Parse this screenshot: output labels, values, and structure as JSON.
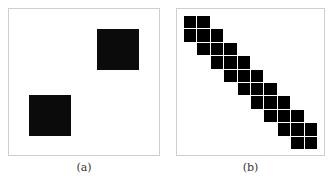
{
  "panels": [
    {
      "id": "a",
      "caption": "(a)",
      "frame": {
        "x": 8,
        "y": 8,
        "w": 152,
        "h": 148
      },
      "squares": [
        {
          "x": 97,
          "y": 29,
          "w": 42,
          "h": 41
        },
        {
          "x": 29,
          "y": 95,
          "w": 42,
          "h": 41
        }
      ]
    },
    {
      "id": "b",
      "caption": "(b)",
      "frame": {
        "x": 176,
        "y": 8,
        "w": 149,
        "h": 148
      },
      "grid": {
        "origin_x": 184,
        "origin_y": 16,
        "cell": 13.4,
        "rows": [
          [
            0,
            1
          ],
          [
            0,
            1,
            2
          ],
          [
            1,
            2,
            3
          ],
          [
            2,
            3,
            4
          ],
          [
            3,
            4,
            5
          ],
          [
            4,
            5,
            6
          ],
          [
            5,
            6,
            7
          ],
          [
            6,
            7,
            8
          ],
          [
            7,
            8,
            9
          ],
          [
            8,
            9
          ]
        ]
      }
    }
  ],
  "colors": {
    "fill": "#000000",
    "frame": "#cfcfcf",
    "background": "#ffffff"
  }
}
